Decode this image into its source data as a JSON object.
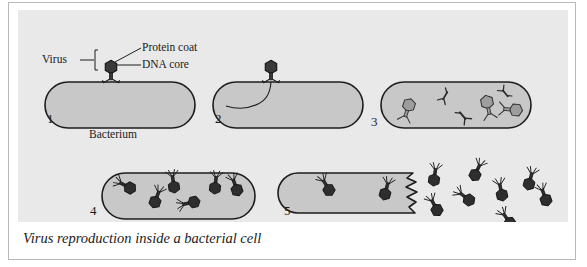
{
  "figure": {
    "title": "Figure 23-5",
    "caption": "Virus reproduction inside a bacterial cell",
    "annotations": {
      "virus": "Virus",
      "protein_coat": "Protein coat",
      "dna_core": "DNA core",
      "bacterium": "Bacterium"
    },
    "panels": [
      {
        "number": "1",
        "name": "attachment",
        "description": "Virus attaches to the bacterium surface"
      },
      {
        "number": "2",
        "name": "injection",
        "description": "Virus injects its DNA core into the bacterium"
      },
      {
        "number": "3",
        "name": "assembly",
        "description": "New virus parts are produced inside the cell"
      },
      {
        "number": "4",
        "name": "maturation",
        "description": "Complete new viruses fill the bacterium"
      },
      {
        "number": "5",
        "name": "lysis",
        "description": "Bacterium bursts releasing the new viruses"
      }
    ],
    "colors": {
      "background": "#e9e9e9",
      "cell_fill": "#c8c8c8",
      "outline": "#1d1d1d",
      "virus_dark": "#2a2a2a",
      "virus_light": "#9a9a9a",
      "card_border": "#b9b9b9"
    }
  }
}
